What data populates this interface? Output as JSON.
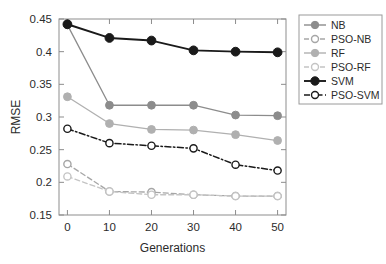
{
  "chart_data": {
    "type": "line",
    "title": "",
    "xlabel": "Generations",
    "ylabel": "RMSE",
    "x": [
      0,
      10,
      20,
      30,
      40,
      50
    ],
    "xticklabels": [
      "0",
      "10",
      "20",
      "30",
      "40",
      "50"
    ],
    "yticks": [
      0.15,
      0.2,
      0.25,
      0.3,
      0.35,
      0.4,
      0.45
    ],
    "yticklabels": [
      "0.15",
      "0.2",
      "0.25",
      "0.3",
      "0.35",
      "0.4",
      "0.45"
    ],
    "xlim": [
      -2,
      52
    ],
    "ylim": [
      0.15,
      0.45
    ],
    "grid": false,
    "legend_position": "outside-right-top",
    "series": [
      {
        "name": "NB",
        "values": [
          0.441,
          0.318,
          0.318,
          0.318,
          0.303,
          0.302
        ],
        "color": "#8c8c8c",
        "linestyle": "solid",
        "marker": "filled-circle"
      },
      {
        "name": "PSO-NB",
        "values": [
          0.228,
          0.186,
          0.185,
          0.181,
          0.179,
          0.179
        ],
        "color": "#a6a6a6",
        "linestyle": "dashed",
        "marker": "open-circle"
      },
      {
        "name": "RF",
        "values": [
          0.331,
          0.29,
          0.281,
          0.28,
          0.273,
          0.264
        ],
        "color": "#b0b0b0",
        "linestyle": "solid",
        "marker": "filled-circle"
      },
      {
        "name": "PSO-RF",
        "values": [
          0.209,
          0.186,
          0.181,
          0.181,
          0.179,
          0.179
        ],
        "color": "#c4c4c4",
        "linestyle": "dashed",
        "marker": "open-circle"
      },
      {
        "name": "SVM",
        "values": [
          0.442,
          0.421,
          0.417,
          0.402,
          0.4,
          0.399
        ],
        "color": "#1a1a1a",
        "linestyle": "solid",
        "marker": "filled-circle"
      },
      {
        "name": "PSO-SVM",
        "values": [
          0.282,
          0.26,
          0.256,
          0.252,
          0.227,
          0.218
        ],
        "color": "#1a1a1a",
        "linestyle": "dashdot",
        "marker": "open-circle"
      }
    ]
  },
  "legend": {
    "items": [
      {
        "label": "NB"
      },
      {
        "label": "PSO-NB"
      },
      {
        "label": "RF"
      },
      {
        "label": "PSO-RF"
      },
      {
        "label": "SVM"
      },
      {
        "label": "PSO-SVM"
      }
    ]
  }
}
